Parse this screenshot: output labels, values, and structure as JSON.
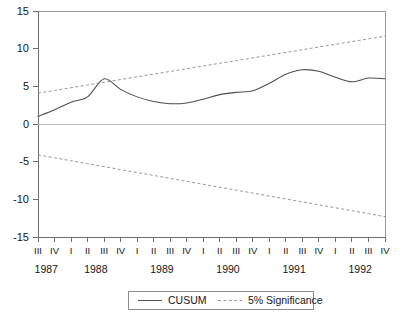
{
  "chart_data": {
    "type": "line",
    "title": "",
    "xlabel": "",
    "ylabel": "",
    "ylim": [
      -15,
      15
    ],
    "yticks": [
      15,
      10,
      5,
      0,
      -5,
      -10,
      -15
    ],
    "ytick_labels": [
      "15",
      "10",
      "5",
      "0",
      "-5",
      "-10",
      "-15"
    ],
    "grid": false,
    "legend_position": "bottom-center",
    "x": [
      "1987:III",
      "1987:IV",
      "1988:I",
      "1988:II",
      "1988:III",
      "1988:IV",
      "1989:I",
      "1989:II",
      "1989:III",
      "1989:IV",
      "1990:I",
      "1990:II",
      "1990:III",
      "1990:IV",
      "1991:I",
      "1991:II",
      "1991:III",
      "1991:IV",
      "1992:I",
      "1992:II",
      "1992:III",
      "1992:IV"
    ],
    "quarter_labels": [
      "III",
      "IV",
      "I",
      "II",
      "III",
      "IV",
      "I",
      "II",
      "III",
      "IV",
      "I",
      "II",
      "III",
      "IV",
      "I",
      "II",
      "III",
      "IV",
      "I",
      "II",
      "III",
      "IV"
    ],
    "year_groups": [
      {
        "year": "1987",
        "start_index": 0,
        "end_index": 1
      },
      {
        "year": "1988",
        "start_index": 2,
        "end_index": 5
      },
      {
        "year": "1989",
        "start_index": 6,
        "end_index": 9
      },
      {
        "year": "1990",
        "start_index": 10,
        "end_index": 13
      },
      {
        "year": "1991",
        "start_index": 14,
        "end_index": 17
      },
      {
        "year": "1992",
        "start_index": 18,
        "end_index": 21
      }
    ],
    "series": [
      {
        "name": "CUSUM",
        "style": "solid",
        "color": "#4e4e4e",
        "values": [
          1.0,
          1.9,
          2.9,
          3.6,
          6.0,
          4.6,
          3.6,
          3.0,
          2.7,
          2.8,
          3.3,
          3.9,
          4.2,
          4.4,
          5.4,
          6.6,
          7.2,
          7.0,
          6.2,
          5.6,
          6.1,
          6.0
        ]
      },
      {
        "name": "5% Significance",
        "style": "dashed",
        "color": "#8c8c8c",
        "values": [
          4.1,
          4.46,
          4.82,
          5.18,
          5.54,
          5.9,
          6.26,
          6.62,
          6.98,
          7.34,
          7.7,
          8.06,
          8.42,
          8.78,
          9.14,
          9.5,
          9.86,
          10.22,
          10.58,
          10.94,
          11.3,
          11.66
        ]
      },
      {
        "name": "5% Significance Lower",
        "style": "dashed",
        "color": "#8c8c8c",
        "values": [
          -4.1,
          -4.49,
          -4.88,
          -5.27,
          -5.66,
          -6.05,
          -6.44,
          -6.83,
          -7.22,
          -7.61,
          -8.0,
          -8.39,
          -8.78,
          -9.17,
          -9.56,
          -9.95,
          -10.34,
          -10.73,
          -11.12,
          -11.51,
          -11.9,
          -12.3
        ]
      }
    ]
  },
  "legend": {
    "entries": [
      {
        "label": "CUSUM",
        "style": "solid"
      },
      {
        "label": "5% Significance",
        "style": "dashed"
      }
    ]
  }
}
